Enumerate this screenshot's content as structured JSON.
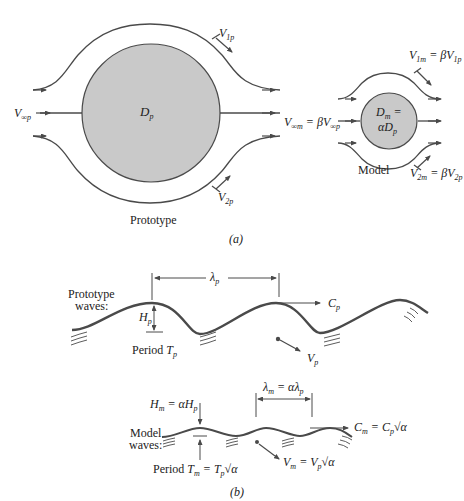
{
  "figure": {
    "panel_a": {
      "caption": "(a)",
      "prototype": {
        "label": "Prototype",
        "body_label": {
          "main": "D",
          "sub": "p"
        },
        "v_inf": {
          "main": "V",
          "sub": "∞p"
        },
        "v1": {
          "main": "V",
          "sub": "1p"
        },
        "v2": {
          "main": "V",
          "sub": "2p"
        }
      },
      "model": {
        "label": "Model",
        "body_label_line1": {
          "main": "D",
          "sub": "m",
          "rest": " ="
        },
        "body_label_line2": {
          "main": "αD",
          "sub": "p"
        },
        "v_inf": {
          "main": "V",
          "sub": "∞m",
          "eq": " = βV",
          "sub2": "∞p"
        },
        "v1": {
          "main": "V",
          "sub": "1m",
          "eq": " = βV",
          "sub2": "1p"
        },
        "v2": {
          "main": "V",
          "sub": "2m",
          "eq": " = βV",
          "sub2": "2p"
        }
      }
    },
    "panel_b": {
      "caption": "(b)",
      "prototype": {
        "label_line1": "Prototype",
        "label_line2": "waves:",
        "wavelength": {
          "main": "λ",
          "sub": "p"
        },
        "height": {
          "main": "H",
          "sub": "p"
        },
        "celerity": {
          "main": "C",
          "sub": "p"
        },
        "velocity": {
          "main": "V",
          "sub": "p"
        },
        "period": {
          "prefix": "Period ",
          "main": "T",
          "sub": "p"
        }
      },
      "model": {
        "label_line1": "Model",
        "label_line2": "waves:",
        "wavelength": {
          "main": "λ",
          "sub": "m",
          "eq": " = αλ",
          "sub2": "p"
        },
        "height": {
          "main": "H",
          "sub": "m",
          "eq": " = αH",
          "sub2": "p"
        },
        "celerity": {
          "main": "C",
          "sub": "m",
          "eq": " = C",
          "sub2": "p",
          "root": "√α"
        },
        "velocity": {
          "main": "V",
          "sub": "m",
          "eq": " = V",
          "sub2": "p",
          "root": "√α"
        },
        "period": {
          "prefix": "Period ",
          "main": "T",
          "sub": "m",
          "eq": " = T",
          "sub2": "p",
          "root": "√α"
        }
      }
    },
    "colors": {
      "body_fill": "#c9c9c9",
      "line": "#4a4a4a",
      "text": "#222222"
    }
  }
}
